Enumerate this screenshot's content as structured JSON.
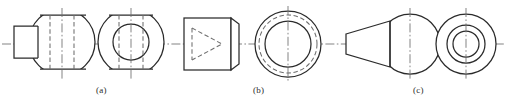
{
  "figure": {
    "kind": "engineering-orthographic-drawing",
    "background_color": "#ffffff",
    "line_color": "#2b2b2b",
    "hidden_line_color": "#6e6e6e",
    "center_line_color": "#6e6e6e",
    "width": 507,
    "height": 108,
    "subfigures": [
      {
        "id": "a",
        "caption": "(a)",
        "caption_x": 96,
        "caption_y": 85,
        "description": "Cylindrical boss joined to a sphere flattened top and bottom, with a through bore",
        "views": [
          {
            "name": "front-view",
            "type": "boss-and-truncated-sphere",
            "boss": {
              "x": 14,
              "y": 26,
              "width": 23,
              "height": 32
            },
            "sphere": {
              "cx": 62,
              "cy": 42,
              "r": 33,
              "flat_top_y": 15,
              "flat_bottom_y": 69
            },
            "hidden_lines": [
              {
                "x": 50,
                "y1": 15,
                "y2": 69
              },
              {
                "x": 74,
                "y1": 15,
                "y2": 69
              }
            ],
            "center_lines": [
              "horizontal",
              "vertical"
            ]
          },
          {
            "name": "side-view",
            "type": "annulus-with-flats",
            "outer_circle": {
              "cx": 131,
              "cy": 42,
              "r": 33,
              "flat_top_y": 15,
              "flat_bottom_y": 69
            },
            "inner_circle": {
              "cx": 131,
              "cy": 42,
              "r": 18
            },
            "hidden_lines": [
              {
                "x": 119,
                "y1": 15,
                "y2": 69
              },
              {
                "x": 143,
                "y1": 15,
                "y2": 69
              }
            ],
            "center_lines": [
              "horizontal",
              "vertical"
            ]
          }
        ]
      },
      {
        "id": "b",
        "caption": "(b)",
        "caption_x": 253,
        "caption_y": 85,
        "description": "Cylinder with chamfered end containing a hidden conical bore",
        "views": [
          {
            "name": "front-view",
            "type": "rectangle-with-chamfer-and-hidden-cone",
            "rectangle": {
              "x": 184,
              "y": 18,
              "width": 47,
              "height": 52
            },
            "chamfer": {
              "x": 231,
              "y_top": 18,
              "y_bottom": 70,
              "depth": 8,
              "inset": 5
            },
            "hidden_cone": {
              "base_x": 192,
              "apex_x": 222,
              "top_y": 28,
              "bottom_y": 60
            },
            "center_lines": [
              "horizontal"
            ]
          },
          {
            "name": "side-view",
            "type": "concentric-circles",
            "circles": [
              {
                "r": 33,
                "style": "solid"
              },
              {
                "r": 29,
                "style": "hidden"
              },
              {
                "r": 23,
                "style": "solid"
              }
            ],
            "cx": 288,
            "cy": 44,
            "center_lines": [
              "horizontal",
              "vertical"
            ]
          }
        ]
      },
      {
        "id": "c",
        "caption": "(c)",
        "caption_x": 413,
        "caption_y": 85,
        "description": "Truncated cone joined to a sphere, shown with three concentric circles in side view",
        "views": [
          {
            "name": "front-view",
            "type": "frustum-and-sphere",
            "frustum": {
              "x_small": 346,
              "x_large": 390,
              "half_small": 10,
              "half_large": 23
            },
            "sphere": {
              "cx": 410,
              "cy": 44,
              "r": 30
            },
            "center_lines": [
              "horizontal",
              "vertical"
            ]
          },
          {
            "name": "side-view",
            "type": "concentric-circles",
            "circles": [
              {
                "r": 30,
                "style": "solid"
              },
              {
                "r": 19,
                "style": "solid"
              },
              {
                "r": 13,
                "style": "solid"
              }
            ],
            "cx": 466,
            "cy": 44,
            "center_lines": [
              "horizontal",
              "vertical"
            ]
          }
        ]
      }
    ],
    "axis_line": {
      "name": "main-horizontal-axis",
      "y": 44,
      "x1": 2,
      "x2": 505
    }
  }
}
